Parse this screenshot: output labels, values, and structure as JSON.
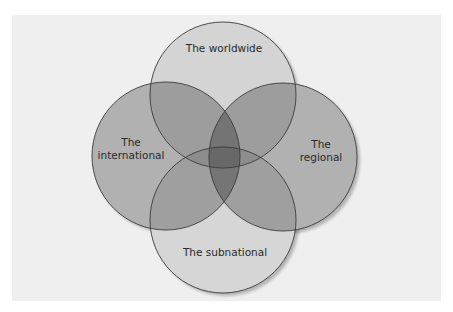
{
  "diagram": {
    "type": "venn",
    "background_color": "#efefef",
    "outline_color": "#3a3a3a",
    "sets": [
      {
        "id": "worldwide",
        "label": "The worldwide",
        "line1": "The worldwide",
        "line2": "",
        "cx": 223,
        "cy": 95,
        "r": 73,
        "shade": "light",
        "fill_opacity": 0.11
      },
      {
        "id": "international",
        "label": "The international",
        "line1": "The",
        "line2": "international",
        "cx": 166,
        "cy": 156,
        "r": 74,
        "shade": "medium",
        "fill_opacity": 0.26
      },
      {
        "id": "regional",
        "label": "The regional",
        "line1": "The",
        "line2": "regional",
        "cx": 283,
        "cy": 157,
        "r": 74,
        "shade": "medium",
        "fill_opacity": 0.26
      },
      {
        "id": "subnational",
        "label": "The subnational",
        "line1": "The subnational",
        "line2": "",
        "cx": 223,
        "cy": 220,
        "r": 73,
        "shade": "light",
        "fill_opacity": 0.1
      }
    ],
    "labels": {
      "worldwide": {
        "line1": "The worldwide",
        "x": 224,
        "y": 48
      },
      "international": {
        "line1": "The",
        "line2": "international",
        "x": 131,
        "y": 149
      },
      "regional": {
        "line1": "The",
        "line2": "regional",
        "x": 321,
        "y": 151
      },
      "subnational": {
        "line1": "The subnational",
        "x": 225,
        "y": 252
      }
    },
    "center_overlap": "worldwide ∩ international ∩ regional ∩ subnational"
  }
}
